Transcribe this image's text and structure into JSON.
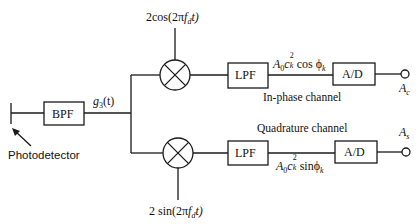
{
  "diagram": {
    "title": "",
    "blocks": {
      "bpf": "BPF",
      "lpf_i": "LPF",
      "lpf_q": "LPF",
      "ad_i": "A/D",
      "ad_q": "A/D"
    },
    "labels": {
      "photodetector": "Photodetector",
      "g3_main": "g",
      "g3_sub": "3",
      "g3_arg": "(t)",
      "cos_ref_pre": "2cos(2π",
      "cos_ref_f": "f",
      "cos_ref_sub": "d",
      "cos_ref_post": "t)",
      "sin_ref_pre": "2 sin(2π",
      "sin_ref_f": "f",
      "sin_ref_sub": "d",
      "sin_ref_post": "t)",
      "i_signal_A": "A",
      "i_signal_A_sub": "0",
      "i_signal_c": "c",
      "i_signal_c_sup": "2",
      "i_signal_c_sub": "k",
      "i_signal_fn": " cos ϕ",
      "i_signal_fn_sub": "k",
      "q_signal_A": "A",
      "q_signal_A_sub": "0",
      "q_signal_c": "c",
      "q_signal_c_sup": "2",
      "q_signal_c_sub": "k",
      "q_signal_fn": " sinϕ",
      "q_signal_fn_sub": "k",
      "in_phase_channel": "In-phase channel",
      "quadrature_channel": "Quadrature channel",
      "out_i": "A",
      "out_i_sub": "c",
      "out_q": "A",
      "out_q_sub": "s"
    },
    "stroke_color": "#1a1a1a",
    "background": "#ffffff"
  }
}
